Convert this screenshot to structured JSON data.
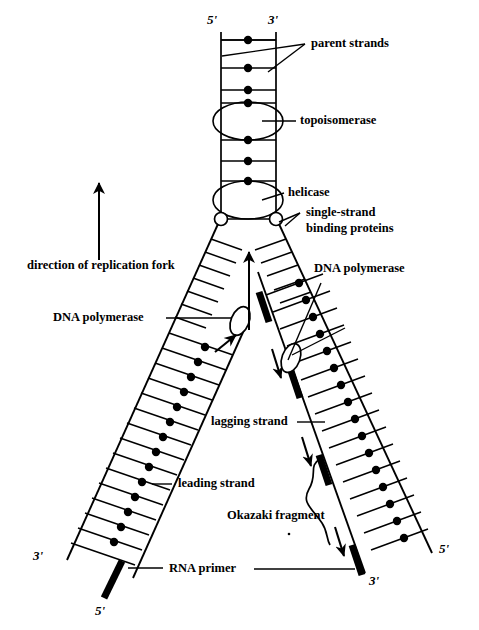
{
  "figure": {
    "type": "biology-diagram",
    "background_color": "#ffffff",
    "ink_color": "#000000"
  },
  "labels": {
    "parent_strands": "parent strands",
    "topoisomerase": "topoisomerase",
    "helicase": "helicase",
    "ssb_line1": "single-strand",
    "ssb_line2": "binding proteins",
    "direction_of_fork": "direction of replication fork",
    "dna_polymerase_left": "DNA polymerase",
    "dna_polymerase_right": "DNA polymerase",
    "lagging_strand": "lagging strand",
    "leading_strand": "leading strand",
    "okazaki_fragment": "Okazaki fragment",
    "rna_primer": "RNA primer"
  },
  "polarity": {
    "parent_left_top": "5'",
    "parent_right_top": "3'",
    "daughter_left_bottom_3": "3'",
    "daughter_left_bottom_5": "5'",
    "daughter_right_bottom_3": "3'",
    "daughter_right_bottom_5": "5'"
  },
  "components": {
    "parent_duplex": {
      "name": "parent duplex",
      "rungs": 7,
      "base_pair_dots": 7
    },
    "topoisomerase_enzyme": {
      "shape": "ellipse",
      "filled": false
    },
    "helicase_enzyme": {
      "shape": "ellipse",
      "filled": false
    },
    "single_strand_binding_proteins": {
      "shape": "small-circle",
      "count": 2
    },
    "leading_strand_arm": {
      "side": "left",
      "polymerase": {
        "shape": "ellipse",
        "filled": false
      },
      "synthesis_arrow": "up-toward-fork",
      "rna_primer_bars": 1
    },
    "lagging_strand_arm": {
      "side": "right",
      "polymerase": {
        "shape": "ellipse",
        "filled": false
      },
      "synthesis_arrow": "down-away-from-fork",
      "rna_primer_bars": 3,
      "okazaki_bracket": true
    },
    "fork_direction_arrow": {
      "direction": "up"
    }
  }
}
